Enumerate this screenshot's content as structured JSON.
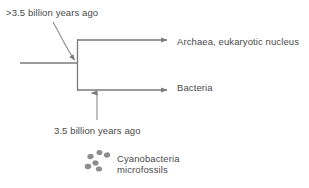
{
  "diagram": {
    "type": "phylogenetic-tree",
    "title_visible": false,
    "background_color": "#ffffff",
    "line_color": "#7a7a7a",
    "text_color": "#4a4a4a",
    "fossil_dot_color": "#8a8a8a"
  },
  "annotations": {
    "root_age": ">3.5 billion years ago",
    "fossil_age": "3.5 billion years ago",
    "microfossils_line1": "Cyanobacteria",
    "microfossils_line2": "microfossils"
  },
  "branches": [
    {
      "id": "archaea",
      "label": "Archaea, eukaryotic nucleus"
    },
    {
      "id": "bacteria",
      "label": "Bacteria"
    }
  ],
  "geometry": {
    "stem_x_start": 20,
    "stem_x_end": 77,
    "stem_y": 63,
    "node_x": 77,
    "top_branch_y": 40,
    "bottom_branch_y": 90,
    "branch_x_end": 172,
    "fossil_arrow_x": 97,
    "fossil_arrow_y_start": 120,
    "fossil_arrow_y_end": 92,
    "curved_arrow_from": [
      60,
      22
    ],
    "curved_arrow_to": [
      76,
      62
    ]
  },
  "fossil_dots": [
    {
      "cx": 90.5,
      "cy": 156.5,
      "rx": 3.2,
      "ry": 2.6,
      "rot": -18
    },
    {
      "cx": 99.5,
      "cy": 152.5,
      "rx": 3.0,
      "ry": 2.5,
      "rot": 12
    },
    {
      "cx": 107.0,
      "cy": 155.0,
      "rx": 3.2,
      "ry": 2.6,
      "rot": -10
    },
    {
      "cx": 95.5,
      "cy": 163.0,
      "rx": 3.1,
      "ry": 2.6,
      "rot": 20
    },
    {
      "cx": 88.0,
      "cy": 166.5,
      "rx": 3.3,
      "ry": 2.7,
      "rot": -8
    },
    {
      "cx": 99.0,
      "cy": 169.0,
      "rx": 3.2,
      "ry": 2.6,
      "rot": 6
    }
  ]
}
